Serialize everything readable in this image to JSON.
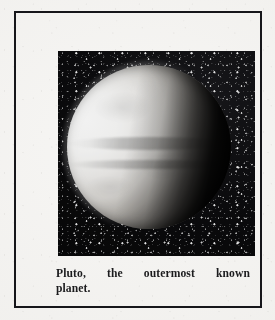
{
  "figure": {
    "caption_line_1_words": [
      "Pluto,",
      "the",
      "outermost",
      "known"
    ],
    "caption_line_2": "planet.",
    "caption_full": "Pluto, the outermost known planet."
  },
  "photo": {
    "subject": "Pluto",
    "alt": "Black and white photograph of the planet Pluto, a bright disc lit from the left with dark horizontal bands, set against a black star field",
    "background_color": "#090909",
    "disc_highlight_color": "#ffffff",
    "terminator_color": "#070707"
  },
  "frame": {
    "border_color": "#16161a",
    "page_color": "#f4f3f1"
  }
}
